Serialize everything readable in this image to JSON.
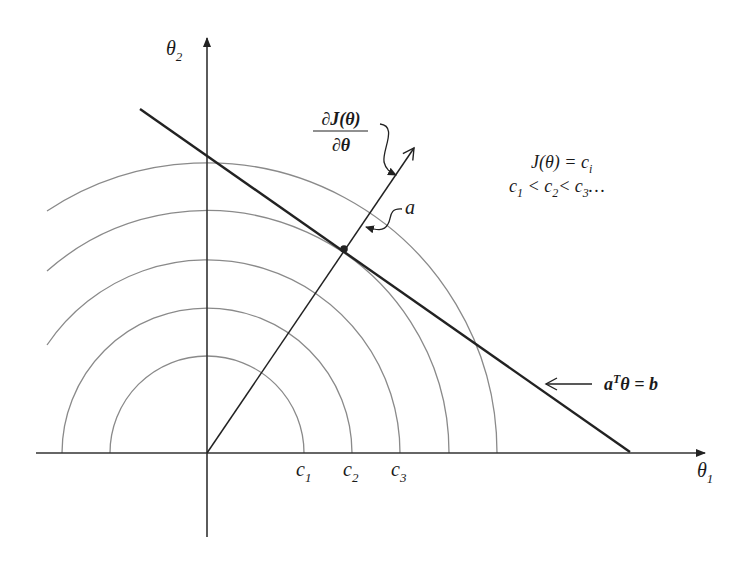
{
  "diagram": {
    "axes": {
      "x_label": "θ",
      "x_sub": "1",
      "y_label": "θ",
      "y_sub": "2"
    },
    "contours": {
      "radii_px": [
        97,
        145,
        193,
        242,
        290
      ],
      "tick_labels": [
        {
          "base": "c",
          "sub": "1"
        },
        {
          "base": "c",
          "sub": "2"
        },
        {
          "base": "c",
          "sub": "3"
        }
      ],
      "color": "#8a8a8a"
    },
    "legend": {
      "line1": "J(θ) = c",
      "line1_sub": "i",
      "line2_parts": [
        "c",
        "1",
        " < c",
        "2",
        "< c",
        "3",
        "…"
      ]
    },
    "gradient_label": {
      "numerator": "∂J(θ)",
      "denominator": "∂θ"
    },
    "vector_label": "a",
    "constraint_label": {
      "a": "a",
      "sup": "T",
      "rest": "θ = b"
    },
    "colors": {
      "ink": "#222222",
      "contour": "#8a8a8a",
      "background": "#ffffff"
    }
  }
}
